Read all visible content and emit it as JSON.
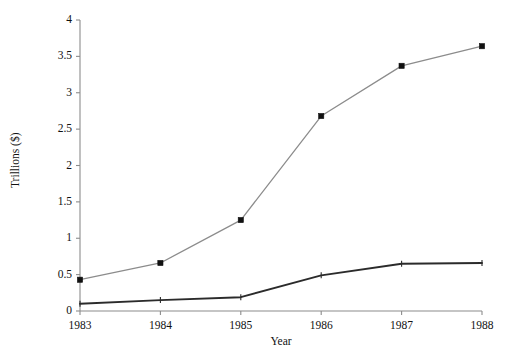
{
  "chart_data": {
    "type": "line",
    "title": "",
    "xlabel": "Year",
    "ylabel": "Trillions ($)",
    "x": [
      1983,
      1984,
      1985,
      1986,
      1987,
      1988
    ],
    "categories": [
      "1983",
      "1984",
      "1985",
      "1986",
      "1987",
      "1988"
    ],
    "xlim": [
      1983,
      1988
    ],
    "ylim": [
      0,
      4
    ],
    "xticks": [
      "1983",
      "1984",
      "1985",
      "1986",
      "1987",
      "1988"
    ],
    "yticks": [
      "0",
      "0.5",
      "1",
      "1.5",
      "2",
      "2.5",
      "3",
      "3.5",
      "4"
    ],
    "grid": false,
    "legend": "none",
    "series": [
      {
        "name": "upper-series",
        "color": "#8c8c8c",
        "marker": "square",
        "marker_color": "#111111",
        "values": [
          0.43,
          0.66,
          1.25,
          2.68,
          3.37,
          3.64
        ]
      },
      {
        "name": "lower-series",
        "color": "#2b2b2b",
        "marker": "none",
        "marker_color": "#2b2b2b",
        "values": [
          0.1,
          0.15,
          0.19,
          0.49,
          0.65,
          0.66
        ]
      }
    ],
    "axis_color": "#8c8c8c",
    "background": "#ffffff"
  },
  "axes": {
    "y_title": "Trillions ($)",
    "x_title": "Year",
    "y_tick_labels": [
      "0",
      "0.5",
      "1",
      "1.5",
      "2",
      "2.5",
      "3",
      "3.5",
      "4"
    ],
    "x_tick_labels": [
      "1983",
      "1984",
      "1985",
      "1986",
      "1987",
      "1988"
    ]
  }
}
